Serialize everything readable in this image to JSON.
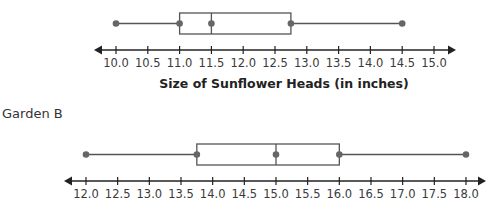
{
  "chart_data": [
    {
      "type": "boxplot",
      "title": "",
      "label": "",
      "xlabel": "Size of Sunflower Heads (in inches)",
      "ylabel": "",
      "xlim": [
        10.0,
        15.0
      ],
      "tick_step": 0.5,
      "ticks": [
        "10.0",
        "10.5",
        "11.0",
        "11.5",
        "12.0",
        "12.5",
        "13.0",
        "13.5",
        "14.0",
        "14.5",
        "15.0"
      ],
      "stats": {
        "min": 10.0,
        "q1": 11.0,
        "median": 11.5,
        "q3": 12.75,
        "max": 14.5
      },
      "grid": false
    },
    {
      "type": "boxplot",
      "title": "",
      "label": "Garden B",
      "xlabel": "",
      "ylabel": "",
      "xlim": [
        12.0,
        18.0
      ],
      "tick_step": 0.5,
      "ticks": [
        "12.0",
        "12.5",
        "13.0",
        "13.5",
        "14.0",
        "14.5",
        "15.0",
        "15.5",
        "16.0",
        "16.5",
        "17.0",
        "17.5",
        "18.0"
      ],
      "stats": {
        "min": 12.0,
        "q1": 13.75,
        "median": 15.0,
        "q3": 16.0,
        "max": 18.0
      },
      "grid": false
    }
  ],
  "colors": {
    "box": "#555555",
    "point": "#666666",
    "axis": "#222222",
    "text": "#333333"
  }
}
